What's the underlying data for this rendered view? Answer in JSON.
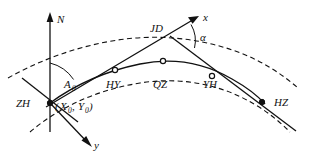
{
  "figure": {
    "background_color": "#ffffff",
    "line_color": "#111111",
    "axes": {
      "north_label": "N",
      "x_label": "x",
      "y_label": "y"
    },
    "angles": {
      "azimuth_label": "A",
      "azimuth_subscript": "0",
      "deflection_label": "α"
    },
    "points": [
      {
        "id": "ZH",
        "label": "ZH",
        "x": 50,
        "y": 103,
        "marker": "filled"
      },
      {
        "id": "HY",
        "label": "HY",
        "x": 115,
        "y": 70,
        "marker": "open"
      },
      {
        "id": "QZ",
        "label": "QZ",
        "x": 163,
        "y": 61,
        "marker": "open"
      },
      {
        "id": "YH",
        "label": "YH",
        "x": 212,
        "y": 76,
        "marker": "open"
      },
      {
        "id": "HZ",
        "label": "HZ",
        "x": 262,
        "y": 102,
        "marker": "filled"
      },
      {
        "id": "JD",
        "label": "JD",
        "x": 163,
        "y": 31,
        "marker": "none"
      }
    ],
    "coordinate_label": {
      "open_paren": "(",
      "x_symbol": "X",
      "x_subscript": "0",
      "comma": ",",
      "y_symbol": "Y",
      "y_subscript": "0",
      "close_paren": ")"
    },
    "curves": {
      "main": "solid",
      "offset_outer": "dashed",
      "offset_inner": "dashed"
    }
  },
  "caption": {
    "text": ""
  }
}
